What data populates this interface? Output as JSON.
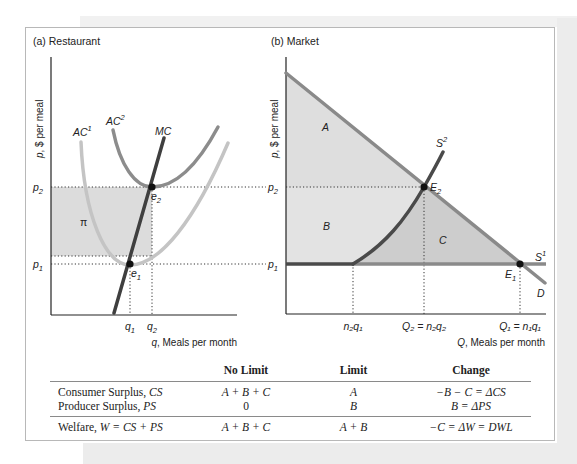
{
  "panels": {
    "restaurant": {
      "title": "(a) Restaurant",
      "y_axis_label": "p, $ per meal",
      "x_axis_label": "q, Meals per month",
      "curves": {
        "ac1": "AC",
        "ac1_sup": "1",
        "ac2": "AC",
        "ac2_sup": "2",
        "mc": "MC"
      },
      "price_labels": {
        "p2": "p",
        "p2_sub": "2",
        "p1": "p",
        "p1_sub": "1"
      },
      "quantity_labels": {
        "q1": "q",
        "q1_sub": "1",
        "q2": "q",
        "q2_sub": "2"
      },
      "points": {
        "e1": "e",
        "e1_sub": "1",
        "e2": "e",
        "e2_sub": "2"
      },
      "profit_area_label": "π"
    },
    "market": {
      "title": "(b) Market",
      "y_axis_label": "p, $ per meal",
      "x_axis_label": "Q, Meals per month",
      "curves": {
        "s1": "S",
        "s1_sup": "1",
        "s2": "S",
        "s2_sup": "2",
        "d": "D"
      },
      "price_labels": {
        "p2": "p",
        "p2_sub": "2",
        "p1": "p",
        "p1_sub": "1"
      },
      "quantity_labels": {
        "n2q1": "n₂q₁",
        "q2": "Q₂ = n₂q₂",
        "q1": "Q₁ = n₁q₁"
      },
      "points": {
        "E1": "E",
        "E1_sub": "1",
        "E2": "E",
        "E2_sub": "2"
      },
      "areas": {
        "a": "A",
        "b": "B",
        "c": "C"
      }
    }
  },
  "colors": {
    "mc": "#3f3f3f",
    "ac1": "#c4c4c4",
    "ac2": "#8c8c8c",
    "demand": "#8a8a8a",
    "s2": "#4a4a4a",
    "s1": "#8a8a8a",
    "profit_fill": "#dcdcdc",
    "area_a": "#dedede",
    "area_b": "#e3e3e3",
    "area_c": "#cdcdcd"
  },
  "table": {
    "headers": [
      "",
      "No Limit",
      "Limit",
      "Change"
    ],
    "rows": [
      {
        "label": "Consumer Surplus, ",
        "label_it": "CS",
        "no_limit": "A + B + C",
        "limit": "A",
        "change": "−B − C = ΔCS"
      },
      {
        "label": "Producer Surplus, ",
        "label_it": "PS",
        "no_limit": "0",
        "limit": "B",
        "change": "B = ΔPS"
      },
      {
        "label": "Welfare, ",
        "label_it": "W = CS + PS",
        "no_limit": "A + B + C",
        "limit": "A + B",
        "change": "−C = ΔW = DWL"
      }
    ]
  }
}
